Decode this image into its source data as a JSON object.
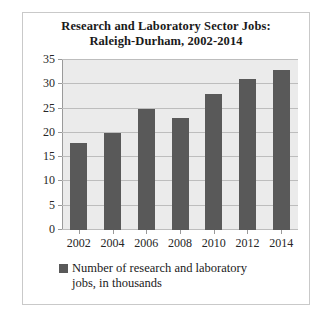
{
  "chart_data": {
    "type": "bar",
    "title": "Research and Laboratory Sector Jobs: Raleigh-Durham, 2002-2014",
    "title_lines": [
      "Research and Laboratory Sector Jobs:",
      "Raleigh-Durham, 2002-2014"
    ],
    "categories": [
      "2002",
      "2004",
      "2006",
      "2008",
      "2010",
      "2012",
      "2014"
    ],
    "values": [
      18,
      20,
      25,
      23,
      28,
      31,
      33
    ],
    "series": [
      {
        "name": "Number of research and laboratory jobs, in thousands",
        "values": [
          18,
          20,
          25,
          23,
          28,
          31,
          33
        ]
      }
    ],
    "xlabel": "",
    "ylabel": "",
    "ylim": [
      0,
      35
    ],
    "ytick_labels": [
      "35",
      "30",
      "25",
      "20",
      "15",
      "10",
      "5",
      "0"
    ],
    "ytick_values": [
      35,
      30,
      25,
      20,
      15,
      10,
      5,
      0
    ],
    "grid": true,
    "legend_position": "bottom",
    "legend": [
      {
        "label_lines": [
          "Number of research and laboratory",
          "jobs, in thousands"
        ],
        "label": "Number of research and laboratory jobs, in thousands",
        "color": "#595959"
      }
    ],
    "colors": {
      "bar": "#595959",
      "plot_background": "#ebebeb",
      "gridline": "#bdbdbd",
      "axis": "#9a9a9a",
      "text": "#1a1a1a",
      "figure_border": "#c9c9c9"
    }
  }
}
